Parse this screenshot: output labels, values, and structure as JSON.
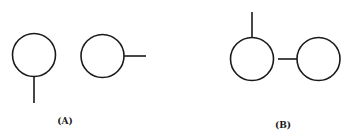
{
  "figure": {
    "panels": [
      {
        "id": "A",
        "label": "(A)",
        "label_pos": {
          "x": 65,
          "y": 116
        },
        "elements": [
          {
            "type": "circle",
            "name": "circle-with-bottom-stem",
            "cx": 34,
            "cy": 55,
            "r": 21.5
          },
          {
            "type": "line",
            "name": "bottom-stem",
            "x1": 34,
            "y1": 76.5,
            "x2": 34,
            "y2": 103
          },
          {
            "type": "circle",
            "name": "circle-with-right-stem",
            "cx": 102.5,
            "cy": 56,
            "r": 21.5
          },
          {
            "type": "line",
            "name": "right-stem",
            "x1": 124,
            "y1": 56,
            "x2": 146,
            "y2": 56
          }
        ]
      },
      {
        "id": "B",
        "label": "(B)",
        "label_pos": {
          "x": 283,
          "y": 120
        },
        "elements": [
          {
            "type": "circle",
            "name": "circle-with-top-stem",
            "cx": 252,
            "cy": 59,
            "r": 21.5
          },
          {
            "type": "line",
            "name": "top-stem",
            "x1": 252,
            "y1": 12,
            "x2": 252,
            "y2": 37.5
          },
          {
            "type": "line",
            "name": "horizontal-connector",
            "x1": 278,
            "y1": 59,
            "x2": 297,
            "y2": 59
          },
          {
            "type": "circle",
            "name": "right-circle",
            "cx": 318.5,
            "cy": 59,
            "r": 21.5
          }
        ]
      }
    ],
    "stroke_color": "#1a1a1a",
    "background_color": "#ffffff"
  }
}
